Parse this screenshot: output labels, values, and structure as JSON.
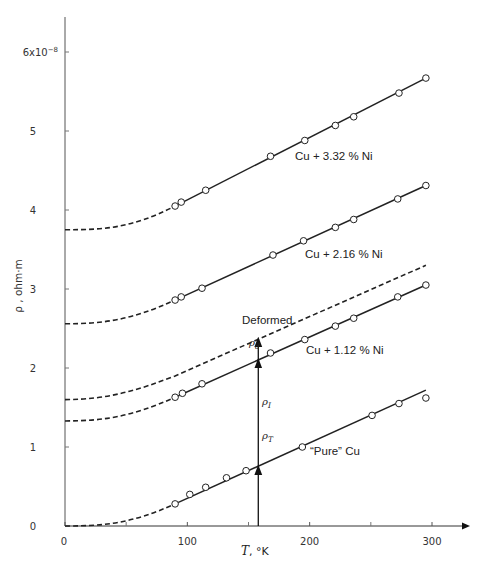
{
  "chart_data": {
    "type": "line",
    "title": "",
    "xlabel": "T, °K",
    "ylabel": "ρ, ohm·m",
    "x_ticks": [
      0,
      100,
      200,
      300
    ],
    "x_tick_labels": [
      "0",
      "100",
      "200",
      "300"
    ],
    "x_minor_ticks": [
      50,
      150,
      250
    ],
    "y_ticks": [
      0,
      1,
      2,
      3,
      4,
      5,
      6
    ],
    "y_tick_labels": [
      "0",
      "1",
      "2",
      "3",
      "4",
      "5",
      "6x10⁻⁸"
    ],
    "xlim": [
      0,
      320
    ],
    "ylim": [
      0,
      6.5
    ],
    "y_scale_note": "×10⁻⁸ ohm·m",
    "grid": false,
    "legend": "inline labels",
    "series": [
      {
        "name": "Cu + 3.32 % Ni",
        "residual_y0": 3.75,
        "line": {
          "x_start": 90,
          "y_start": 4.05,
          "x_end": 295,
          "y_end": 5.67
        },
        "points": [
          [
            90,
            4.05
          ],
          [
            95,
            4.1
          ],
          [
            115,
            4.25
          ],
          [
            168,
            4.68
          ],
          [
            196,
            4.88
          ],
          [
            221,
            5.07
          ],
          [
            236,
            5.18
          ],
          [
            273,
            5.48
          ],
          [
            295,
            5.67
          ]
        ]
      },
      {
        "name": "Cu + 2.16 % Ni",
        "residual_y0": 2.56,
        "line": {
          "x_start": 90,
          "y_start": 2.86,
          "x_end": 295,
          "y_end": 4.31
        },
        "points": [
          [
            90,
            2.86
          ],
          [
            95,
            2.9
          ],
          [
            112,
            3.01
          ],
          [
            170,
            3.43
          ],
          [
            195,
            3.61
          ],
          [
            221,
            3.78
          ],
          [
            236,
            3.88
          ],
          [
            272,
            4.14
          ],
          [
            295,
            4.31
          ]
        ]
      },
      {
        "name": "Deformed",
        "residual_y0": 1.6,
        "style": "dashed",
        "line": {
          "x_start": 0,
          "y_start": 1.6,
          "x_end": 295,
          "y_end": 3.3
        },
        "points": []
      },
      {
        "name": "Cu + 1.12 % Ni",
        "residual_y0": 1.33,
        "line": {
          "x_start": 90,
          "y_start": 1.63,
          "x_end": 295,
          "y_end": 3.05
        },
        "points": [
          [
            90,
            1.63
          ],
          [
            96,
            1.68
          ],
          [
            112,
            1.8
          ],
          [
            168,
            2.19
          ],
          [
            196,
            2.36
          ],
          [
            221,
            2.53
          ],
          [
            236,
            2.63
          ],
          [
            272,
            2.9
          ],
          [
            295,
            3.05
          ]
        ]
      },
      {
        "name": "“Pure” Cu",
        "residual_y0": 0.0,
        "line": {
          "x_start": 90,
          "y_start": 0.28,
          "x_end": 295,
          "y_end": 1.72
        },
        "points": [
          [
            90,
            0.28
          ],
          [
            102,
            0.4
          ],
          [
            115,
            0.49
          ],
          [
            132,
            0.61
          ],
          [
            148,
            0.7
          ],
          [
            194,
            1.0
          ],
          [
            251,
            1.4
          ],
          [
            273,
            1.55
          ],
          [
            295,
            1.62
          ]
        ]
      }
    ],
    "annotations": [
      {
        "label": "ρ_T",
        "type": "arrow",
        "x": 158,
        "y_from": 0,
        "y_to": 0.75
      },
      {
        "label": "ρ_I",
        "type": "arrow",
        "x": 158,
        "y_from": 0.75,
        "y_to": 2.1
      },
      {
        "label": "ρ_d",
        "type": "arrow",
        "x": 158,
        "y_from": 2.1,
        "y_to": 2.37
      }
    ]
  },
  "labels": {
    "y_axis_title": "ρ , ohm·m",
    "x_axis_title": "T, °K",
    "series_3_32": "Cu + 3.32 % Ni",
    "series_2_16": "Cu + 2.16 % Ni",
    "series_deformed": "Deformed",
    "series_1_12": "Cu + 1.12 % Ni",
    "series_pure": "“Pure” Cu",
    "rho_T": "ρ",
    "rho_T_sub": "T",
    "rho_I": "ρ",
    "rho_I_sub": "I",
    "rho_d": "ρ",
    "rho_d_sub": "d",
    "y_exp_base": "6x10",
    "y_exp_sup": "−8"
  }
}
